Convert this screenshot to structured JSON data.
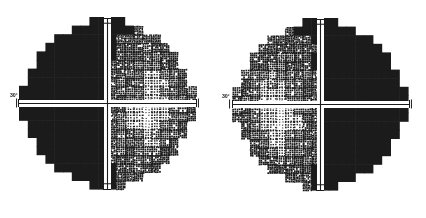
{
  "figure": {
    "type": "visual-field-grayscale-pair",
    "background_color": "#ffffff",
    "ink_color": "#1b1b1b",
    "width": 426,
    "height": 218
  },
  "plots": [
    {
      "id": "left-eye-field",
      "name": "left-visual-field-plot",
      "axis_label": "30°",
      "center_x": 107,
      "center_y": 103,
      "radius_x": 88,
      "radius_y": 86,
      "dark_half": "left",
      "x_axis": {
        "start_x": 18,
        "end_x": 196,
        "y": 103,
        "tick_offsets": [
          -88,
          -62,
          -31,
          31,
          62,
          88
        ],
        "tick_height": 9
      },
      "y_axis": {
        "x": 107,
        "start_y": 18,
        "end_y": 189,
        "tick_offsets": [
          -85,
          -55,
          -28,
          28,
          55,
          85
        ],
        "tick_width": 9
      }
    },
    {
      "id": "right-eye-field",
      "name": "right-visual-field-plot",
      "axis_label": "30°",
      "center_x": 320,
      "center_y": 104,
      "radius_x": 88,
      "radius_y": 86,
      "dark_half": "right",
      "x_axis": {
        "start_x": 232,
        "end_x": 409,
        "y": 104,
        "tick_offsets": [
          -88,
          -62,
          -31,
          31,
          62,
          88
        ],
        "tick_height": 9
      },
      "y_axis": {
        "x": 320,
        "start_y": 19,
        "end_y": 190,
        "tick_offsets": [
          -85,
          -55,
          -28,
          28,
          55,
          85
        ],
        "tick_width": 9
      }
    }
  ],
  "chart_data": {
    "type": "heatmap",
    "title": "",
    "subtitle": "",
    "xlabel": "",
    "ylabel": "",
    "legend": [],
    "annotations": [
      "30°",
      "30°"
    ],
    "grid": false,
    "cell_size_deg": 6,
    "axis_ranges": {
      "x": [
        -30,
        30
      ],
      "y": [
        -30,
        30
      ]
    },
    "tick_values_deg": [
      -30,
      -21,
      -10,
      10,
      21,
      30
    ],
    "density_scale": [
      {
        "level": 0,
        "label": "normal",
        "fill_fraction": 0.06
      },
      {
        "level": 1,
        "label": "mild",
        "fill_fraction": 0.14
      },
      {
        "level": 2,
        "label": "moderate",
        "fill_fraction": 0.28
      },
      {
        "level": 3,
        "label": "marked",
        "fill_fraction": 0.48
      },
      {
        "level": 4,
        "label": "severe",
        "fill_fraction": 0.72
      },
      {
        "level": 5,
        "label": "absolute",
        "fill_fraction": 1.0
      }
    ],
    "series": [
      {
        "name": "left-eye-field",
        "defect_pattern": "left homonymous hemianopia, dense left half",
        "dark_side": "left",
        "values_note": "levels sampled on a 30x30 grid, 0 = seeing, 5 = absolute scotoma"
      },
      {
        "name": "right-eye-field",
        "defect_pattern": "right homonymous hemianopia, dense right half",
        "dark_side": "right",
        "values_note": "levels sampled on a 30x30 grid, 0 = seeing, 5 = absolute scotoma"
      }
    ]
  }
}
